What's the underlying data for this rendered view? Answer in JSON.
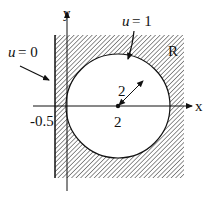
{
  "diagram": {
    "type": "region-boundary-value",
    "region_label": "R",
    "axes": {
      "x_label": "x",
      "y_label": "y"
    },
    "boundaries": [
      {
        "name": "left-wall",
        "condition": "u = 0",
        "position": "x = -0.5"
      },
      {
        "name": "circle",
        "condition": "u = 1",
        "center_x": "2",
        "radius": "2"
      }
    ],
    "labels": {
      "u0": "u = 0",
      "u0_var": "u",
      "u0_eq": "= 0",
      "u1_var": "u",
      "u1_eq": "= 1",
      "wall_x": "-0.5",
      "center": "2",
      "radius": "2",
      "region": "R",
      "x_axis": "x",
      "y_axis": "y"
    },
    "colors": {
      "ink": "#111111",
      "background": "#ffffff"
    }
  }
}
